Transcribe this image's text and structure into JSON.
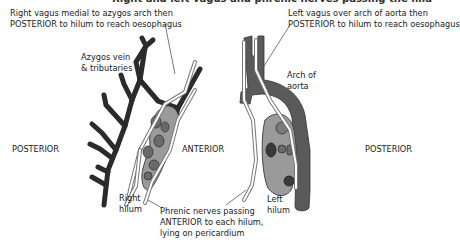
{
  "title_partial": "Right and left vagus and phrenic nerves passing the hila",
  "labels": {
    "right_vagus_line1": "Right vagus medial to azygos arch then",
    "right_vagus_line2": "POSTERIOR to hilum to reach oesophagus",
    "left_vagus_line1": "Left vagus over arch of aorta then",
    "left_vagus_line2": "POSTERIOR to hilum to reach oesophagus",
    "azygos_line1": "Azygos vein",
    "azygos_line2": "& tributaries",
    "arch_line1": "Arch of",
    "arch_line2": "aorta",
    "posterior_left": "POSTERIOR",
    "anterior": "ANTERIOR",
    "posterior_right": "POSTERIOR",
    "right_hilum_line1": "Right",
    "right_hilum_line2": "hilum",
    "left_hilum_line1": "Left",
    "left_hilum_line2": "hilum",
    "phrenic_line1": "Phrenic nerves passing",
    "phrenic_line2": "ANTERIOR to each hilum,",
    "phrenic_line3": "lying on pericardium"
  },
  "colors": {
    "azygos": "#2b2b2b",
    "aorta": "#5a5a5a",
    "hilum_fill": "#9a9a9a",
    "hilum_vessel": "#6a6a6a",
    "nerve_fill": "#ffffff",
    "nerve_outline": "#777777"
  }
}
